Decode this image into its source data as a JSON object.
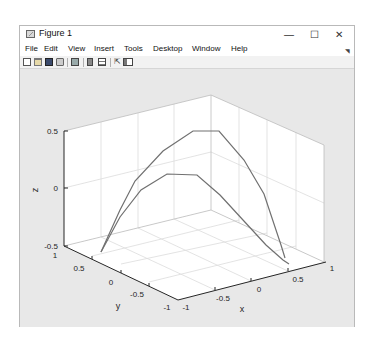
{
  "window": {
    "title": "Figure 1",
    "controls": {
      "minimize": "—",
      "maximize": "☐",
      "close": "✕"
    }
  },
  "menubar": {
    "items": [
      "File",
      "Edit",
      "View",
      "Insert",
      "Tools",
      "Desktop",
      "Window",
      "Help"
    ],
    "overflow_icon": "◥"
  },
  "toolbar": {
    "icons": [
      "new-figure-icon",
      "open-file-icon",
      "save-icon",
      "print-icon",
      "link-plot-icon",
      "insert-colorbar-icon",
      "insert-legend-icon",
      "pointer-icon",
      "property-editor-icon"
    ]
  },
  "chart_data": {
    "type": "line",
    "projection": "3d",
    "title": "",
    "xlabel": "x",
    "ylabel": "y",
    "zlabel": "z",
    "xlim": [
      -1,
      1
    ],
    "ylim": [
      -1,
      1
    ],
    "zlim": [
      -0.5,
      0.5
    ],
    "xticks": [
      "-1",
      "-0.5",
      "0",
      "0.5",
      "1"
    ],
    "yticks": [
      "-1",
      "-0.5",
      "0",
      "0.5",
      "1"
    ],
    "zticks": [
      "-0.5",
      "0",
      "0.5"
    ],
    "grid": true,
    "box": "full 3-D axes box with back walls and floor gridlines",
    "series": [
      {
        "name": "upper curve",
        "color": "#707070",
        "description": "arched curve rising from z≈-0.5 near (x=-1,y=1) to peak z≈0.5 then falling to z≈-0.45 near (x=1,y=-1)",
        "points_screen": [
          [
            101,
            252
          ],
          [
            120,
            210
          ],
          [
            135,
            181
          ],
          [
            163,
            151
          ],
          [
            193,
            131
          ],
          [
            219,
            131
          ],
          [
            244,
            160
          ],
          [
            264,
            194
          ],
          [
            281,
            245
          ],
          [
            285,
            258
          ]
        ]
      },
      {
        "name": "lower curve",
        "color": "#707070",
        "description": "lower arched curve with peak z≈0.1",
        "points_screen": [
          [
            101,
            252
          ],
          [
            120,
            217
          ],
          [
            141,
            190
          ],
          [
            167,
            174
          ],
          [
            197,
            175
          ],
          [
            220,
            195
          ],
          [
            243,
            220
          ],
          [
            266,
            245
          ],
          [
            283,
            260
          ],
          [
            289,
            264
          ]
        ]
      }
    ]
  }
}
